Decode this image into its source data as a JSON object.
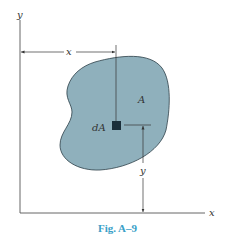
{
  "figure": {
    "caption": "Fig. A–9",
    "labels": {
      "x_axis": "x",
      "y_axis": "y",
      "x_dimension": "x",
      "y_dimension": "y",
      "area": "A",
      "element": "dA"
    },
    "colors": {
      "region_fill": "#8fb0bc",
      "element_fill": "#1b2f3a",
      "caption": "#3a9fc8",
      "lines": "#333333"
    }
  }
}
